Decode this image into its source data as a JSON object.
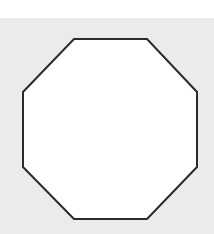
{
  "diagram": {
    "shape": "octagon",
    "fill": "#ffffff",
    "stroke": "#2b2b2b",
    "stroke_width": 2,
    "background": "#ebebeb",
    "points": "74,39 147,39 197,92 197,167 147,219 74,219 23,167 23,92"
  }
}
